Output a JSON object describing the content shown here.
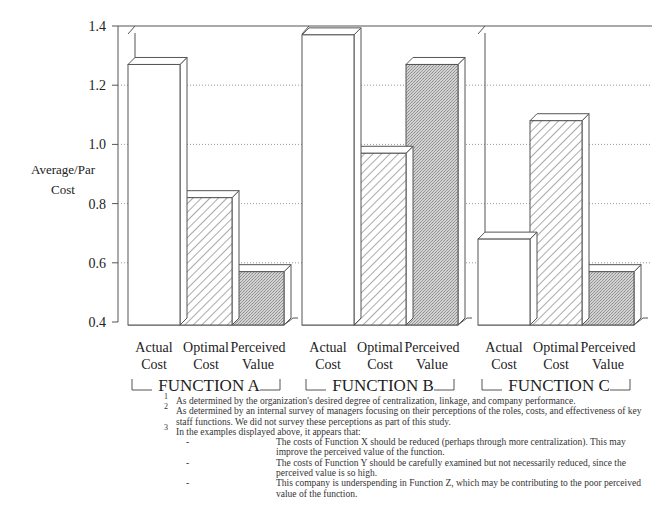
{
  "chart_data": {
    "type": "bar",
    "title": "",
    "ylabel": "Average/Par Cost",
    "xlabel": "",
    "ylim": [
      0.4,
      1.4
    ],
    "yticks": [
      0.4,
      0.6,
      0.8,
      1.0,
      1.2,
      1.4
    ],
    "ytick_labels": [
      "0.4",
      "0.6",
      "0.8",
      "1.0",
      "1.2",
      "1.4"
    ],
    "grid": "dotted horizontal",
    "style": "3d bars",
    "groups": [
      "FUNCTION A",
      "FUNCTION B",
      "FUNCTION C"
    ],
    "categories": [
      "Actual Cost",
      "Optimal Cost",
      "Perceived Value"
    ],
    "series": [
      {
        "name": "Actual Cost",
        "pattern": "white",
        "values": [
          1.27,
          1.37,
          0.68
        ]
      },
      {
        "name": "Optimal Cost",
        "pattern": "diagonal-hatch",
        "values": [
          0.82,
          0.97,
          1.08
        ]
      },
      {
        "name": "Perceived Value",
        "pattern": "gray-stipple",
        "values": [
          0.57,
          1.27,
          0.57
        ]
      }
    ]
  },
  "axis": {
    "ylabel_line1": "Average/Par",
    "ylabel_line2": "Cost"
  },
  "bar_labels": [
    {
      "line1": "Actual",
      "line2": "Cost"
    },
    {
      "line1": "Optimal",
      "line2": "Cost"
    },
    {
      "line1": "Perceived",
      "line2": "Value"
    }
  ],
  "footnotes": {
    "n1": {
      "num": "1",
      "text": "As determined by the organization's desired degree of centralization, linkage, and company performance."
    },
    "n2": {
      "num": "2",
      "text": "As determined by an internal survey of managers focusing on their perceptions of the roles, costs, and effectiveness of key staff functions.  We did not survey these perceptions as part of this study."
    },
    "n3": {
      "num": "3",
      "text": "In the examples displayed above, it appears that:"
    },
    "bullets": [
      {
        "dash": "-",
        "text": "The costs of Function X should be reduced (perhaps through more centralization).  This may improve the perceived value of the function."
      },
      {
        "dash": "-",
        "text": "The costs of Function Y should be carefully examined but not necessarily reduced, since the perceived value is so high."
      },
      {
        "dash": "-",
        "text": "This company is underspending in Function Z, which may be contributing to the poor perceived value of the function."
      }
    ]
  },
  "colors": {
    "line": "#555555",
    "grid": "#9a9a9a",
    "stipple": "#c4c4c4",
    "hatch": "#555555"
  }
}
